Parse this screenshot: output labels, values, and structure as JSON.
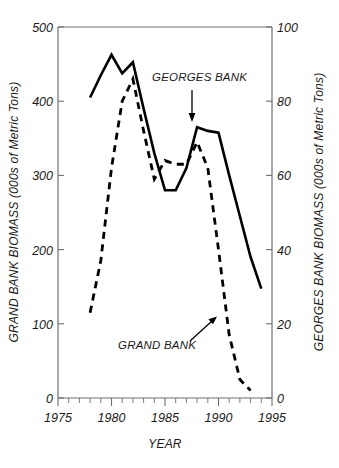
{
  "chart_data": {
    "type": "line",
    "title": "",
    "xlabel": "YEAR",
    "ylabel": "GRAND BANK BIOMASS (000s of Metric Tons)",
    "y2label": "GEORGES BANK BIOMASS (000s of Metric Tons)",
    "xlim": [
      1975,
      1995
    ],
    "ylim": [
      0,
      500
    ],
    "y2lim": [
      0,
      100
    ],
    "xticks": [
      1975,
      1980,
      1985,
      1990,
      1995
    ],
    "xticklabels": [
      "1975",
      "1980",
      "1985",
      "1990",
      "1995"
    ],
    "yticks": [
      0,
      100,
      200,
      300,
      400,
      500
    ],
    "yticklabels": [
      "0",
      "100",
      "200",
      "300",
      "400",
      "500"
    ],
    "y2ticks": [
      0,
      20,
      40,
      60,
      80,
      100
    ],
    "y2ticklabels": [
      "0",
      "20",
      "40",
      "60",
      "80",
      "100"
    ],
    "x_minor_tick_interval": 1,
    "grid": false,
    "legend_position": "inline-annotations",
    "series": [
      {
        "name": "GEORGES BANK",
        "style": "solid",
        "axis": "right",
        "color": "#000000",
        "x": [
          1978,
          1979,
          1980,
          1981,
          1982,
          1983,
          1984,
          1985,
          1986,
          1987,
          1988,
          1989,
          1990,
          1991,
          1992,
          1993,
          1994
        ],
        "values": [
          81,
          87,
          92.5,
          87.5,
          90.5,
          78,
          66,
          56,
          56,
          62,
          73,
          72,
          71.5,
          60,
          49,
          38,
          29.5
        ],
        "values_left_axis_equivalent": [
          405,
          435,
          462,
          437,
          452,
          390,
          330,
          280,
          280,
          310,
          365,
          360,
          358,
          300,
          245,
          190,
          148
        ]
      },
      {
        "name": "GRAND BANK",
        "style": "dashed",
        "axis": "left",
        "color": "#000000",
        "x": [
          1978,
          1979,
          1980,
          1981,
          1982,
          1983,
          1984,
          1985,
          1986,
          1987,
          1988,
          1989,
          1990,
          1991,
          1992,
          1993
        ],
        "values_right_axis_scale": [
          23,
          37,
          62,
          80,
          86,
          72,
          59,
          64,
          63,
          63,
          69,
          62,
          40,
          17,
          5,
          2
        ],
        "values": [
          115,
          185,
          310,
          400,
          430,
          360,
          295,
          320,
          315,
          315,
          345,
          310,
          200,
          85,
          25,
          10
        ]
      }
    ],
    "annotations": [
      {
        "text": "GEORGES BANK",
        "arrow": "down",
        "points_to_series": "GEORGES BANK"
      },
      {
        "text": "GRAND BANK",
        "arrow": "up-right",
        "points_to_series": "GRAND BANK"
      }
    ]
  },
  "axes": {
    "left_title": "GRAND BANK BIOMASS (000s of Metric Tons)",
    "right_title": "GEORGES BANK BIOMASS (000s of Metric Tons)",
    "x_title": "YEAR",
    "left_labels": [
      "500",
      "400",
      "300",
      "200",
      "100",
      "0"
    ],
    "right_labels": [
      "100",
      "80",
      "60",
      "40",
      "20",
      "0"
    ],
    "x_labels": [
      "1975",
      "1980",
      "1985",
      "1990",
      "1995"
    ]
  },
  "annotations": {
    "georges_bank": "GEORGES BANK",
    "grand_bank": "GRAND BANK"
  },
  "colors": {
    "line": "#000000",
    "axis": "#6e6e6e",
    "text": "#1a1a1a",
    "background": "#ffffff"
  }
}
